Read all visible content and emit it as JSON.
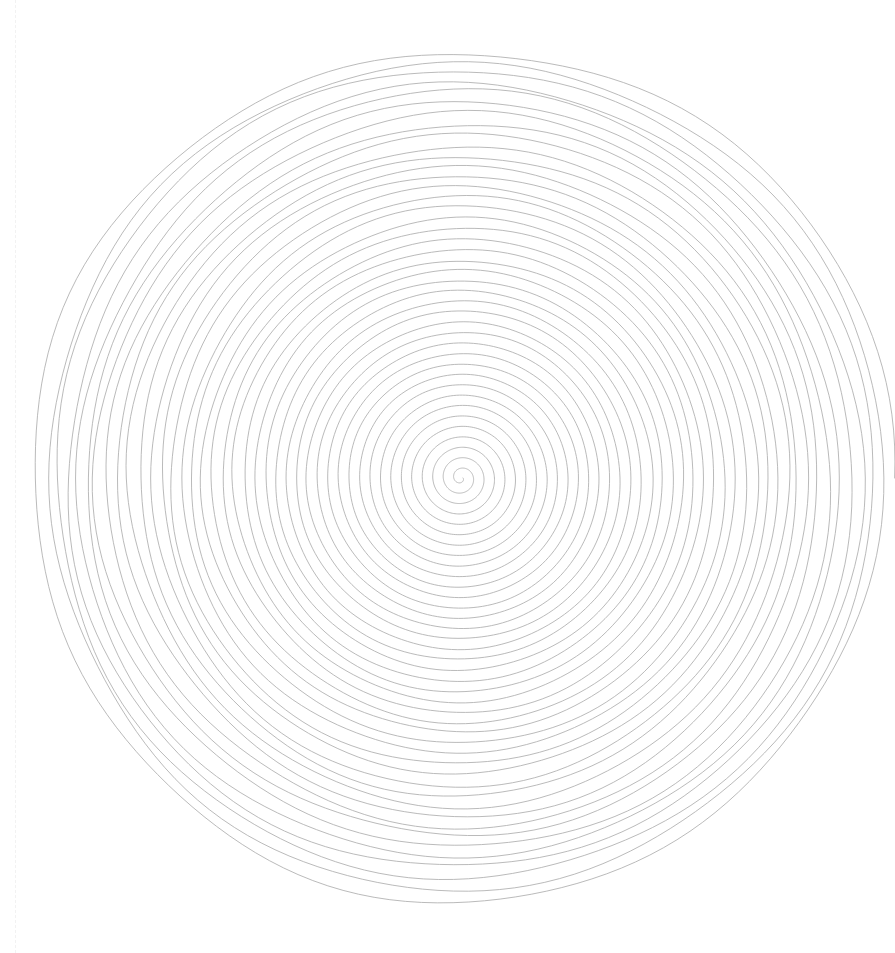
{
  "canvas": {
    "width": 895,
    "height": 953,
    "background_color": "#ffffff",
    "title": "Concentric Spiral Line Drawing"
  },
  "guide": {
    "name": "vertical-dashed-guide",
    "x": 15,
    "color": "#f2f2f2",
    "width": 1,
    "dash": "2 4"
  },
  "chart_data": {
    "type": "line",
    "title": "Concentric Spiral Line Drawing",
    "subtitle": "",
    "xlabel": "",
    "ylabel": "",
    "grid": false,
    "legend_position": "none",
    "render": "archimedean-spiral",
    "stroke_color": "#a9a9a9",
    "stroke_width": 0.85,
    "stroke_opacity": 0.95,
    "center_x": 461,
    "center_y": 478,
    "turns": 41,
    "ring_spacing_px": 10.5,
    "start_radius": 2,
    "end_radius": 432,
    "radius_x_scale": 1.0,
    "radius_y_scale": 0.995,
    "samples_per_turn": 170,
    "jitter": {
      "radial_amplitude": 2.6,
      "radial_frequency": 3.1,
      "secondary_amplitude": 1.5,
      "secondary_frequency": 7.4,
      "vertical_bias": 1.35,
      "outer_growth_exponent": 1.8,
      "seed": 1871
    },
    "extent": {
      "left": 42,
      "right": 880,
      "top": 45,
      "bottom": 915
    },
    "end_caps": [
      {
        "name": "outer-terminus-right",
        "x": 875,
        "y": 475
      },
      {
        "name": "outer-terminus-left",
        "x": 45,
        "y": 485
      }
    ],
    "series": [
      {
        "name": "spiral",
        "description": "single continuous archimedean spiral, 41 revolutions, center to outer edge"
      }
    ],
    "xlim": [
      0,
      895
    ],
    "ylim": [
      0,
      953
    ]
  }
}
